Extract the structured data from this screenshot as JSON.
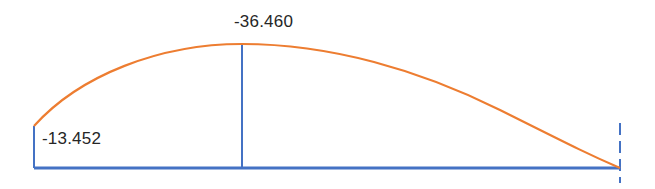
{
  "diagram": {
    "type": "moment-diagram",
    "colors": {
      "curve": "#ED7D31",
      "axis": "#4472C4",
      "label": "#262626"
    },
    "labels": {
      "peak_value": "-36.460",
      "left_value": "-13.452"
    },
    "points": {
      "left_support": {
        "x": 34,
        "y": 126,
        "value": -13.452
      },
      "peak": {
        "x": 242,
        "y": 44,
        "value": -36.46
      },
      "right_end": {
        "x": 620,
        "y": 168,
        "value": 0
      }
    },
    "baseline": {
      "x1": 34,
      "x2": 620,
      "y": 168
    }
  }
}
